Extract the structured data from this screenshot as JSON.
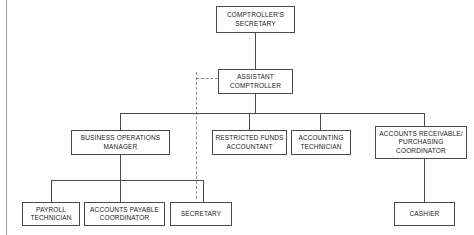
{
  "diagram": {
    "type": "org-chart",
    "colors": {
      "box_border": "#4a4a4a",
      "connector": "#4a4a4a",
      "dashed_connector": "#8d8d8d",
      "page_border": "#9a9a9a",
      "background": "#ffffff",
      "text": "#1a1a1a"
    },
    "nodes": {
      "comptrollers_secretary": "COMPTROLLER'S\nSECRETARY",
      "assistant_comptroller": "ASSISTANT\nCOMPTROLLER",
      "business_operations_manager": "BUSINESS OPERATIONS\nMANAGER",
      "restricted_funds_accountant": "RESTRICTED FUNDS\nACCOUNTANT",
      "accounting_technician": "ACCOUNTING\nTECHNICIAN",
      "accounts_receivable_purchasing_coordinator": "ACCOUNTS RECEIVABLE/\nPURCHASING\nCOORDINATOR",
      "payroll_technician": "PAYROLL\nTECHNICIAN",
      "accounts_payable_coordinator": "ACCOUNTS PAYABLE\nCOORDINATOR",
      "secretary": "SECRETARY",
      "cashier": "CASHIER"
    },
    "edges": [
      {
        "from": "comptrollers_secretary",
        "to": "assistant_comptroller",
        "style": "solid"
      },
      {
        "from": "assistant_comptroller",
        "to": "business_operations_manager",
        "style": "solid"
      },
      {
        "from": "assistant_comptroller",
        "to": "restricted_funds_accountant",
        "style": "solid"
      },
      {
        "from": "assistant_comptroller",
        "to": "accounting_technician",
        "style": "solid"
      },
      {
        "from": "assistant_comptroller",
        "to": "accounts_receivable_purchasing_coordinator",
        "style": "solid"
      },
      {
        "from": "assistant_comptroller",
        "to": "secretary",
        "style": "dashed"
      },
      {
        "from": "business_operations_manager",
        "to": "payroll_technician",
        "style": "solid"
      },
      {
        "from": "business_operations_manager",
        "to": "accounts_payable_coordinator",
        "style": "solid"
      },
      {
        "from": "business_operations_manager",
        "to": "secretary",
        "style": "solid"
      },
      {
        "from": "accounts_receivable_purchasing_coordinator",
        "to": "cashier",
        "style": "solid"
      }
    ]
  }
}
